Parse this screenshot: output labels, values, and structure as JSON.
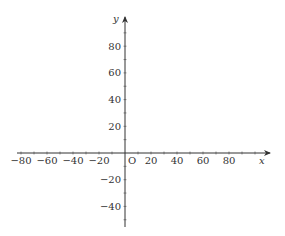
{
  "chart_data": {
    "type": "line",
    "title": "",
    "xlabel": "x",
    "ylabel": "y",
    "origin_label": "O",
    "xlim": [
      -83,
      112
    ],
    "ylim": [
      -55,
      102
    ],
    "x_ticks_major": [
      -80,
      -60,
      -40,
      -20,
      20,
      40,
      60,
      80
    ],
    "x_tick_labels": [
      "−80",
      "−60",
      "−40",
      "−20",
      "20",
      "40",
      "60",
      "80"
    ],
    "y_ticks_major": [
      -40,
      -20,
      20,
      40,
      60,
      80
    ],
    "y_tick_labels": [
      "−40",
      "−20",
      "20",
      "40",
      "60",
      "80"
    ],
    "minor_tick_step": 10,
    "grid": false,
    "series": []
  },
  "colors": {
    "axis": "#333333",
    "background": "#ffffff"
  }
}
